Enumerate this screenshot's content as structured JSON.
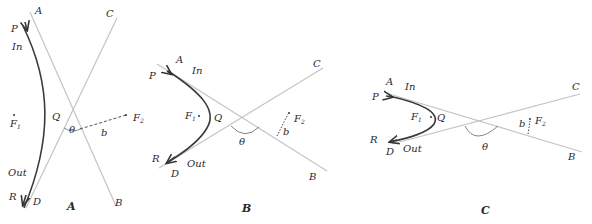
{
  "figure": {
    "panels": [
      {
        "id": "A",
        "caption": "A",
        "labels": {
          "asymptote_start": "A",
          "asymptote_end": "B",
          "asymptote2_start": "C",
          "asymptote2_end": "D",
          "path_start": "P",
          "path_end": "R",
          "incoming": "In",
          "outgoing": "Out",
          "vertex": "Q",
          "focus1": "F",
          "focus1_sub": "1",
          "focus2": "F",
          "focus2_sub": "2",
          "angle": "θ",
          "impact_parameter": "b"
        }
      },
      {
        "id": "B",
        "caption": "B",
        "labels": {
          "asymptote_start": "A",
          "asymptote_end": "B",
          "asymptote2_start": "C",
          "asymptote2_end": "D",
          "path_start": "P",
          "path_end": "R",
          "incoming": "In",
          "outgoing": "Out",
          "vertex": "Q",
          "focus1": "F",
          "focus1_sub": "1",
          "focus2": "F",
          "focus2_sub": "2",
          "angle": "θ",
          "impact_parameter": "b"
        }
      },
      {
        "id": "C",
        "caption": "C",
        "labels": {
          "asymptote_start": "A",
          "asymptote_end": "B",
          "asymptote2_start": "C",
          "asymptote2_end": "D",
          "path_start": "P",
          "path_end": "R",
          "incoming": "In",
          "outgoing": "Out",
          "vertex": "Q",
          "focus1": "F",
          "focus1_sub": "1",
          "focus2": "F",
          "focus2_sub": "2",
          "angle": "θ",
          "impact_parameter": "b"
        }
      }
    ]
  }
}
